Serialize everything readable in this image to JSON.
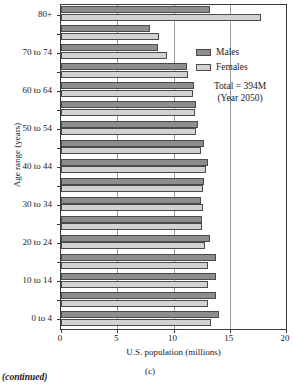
{
  "chart_data": {
    "type": "bar",
    "orientation": "horizontal",
    "title": "",
    "xlabel": "U.S. population (millions)",
    "ylabel": "Age range (years)",
    "xlim": [
      0,
      20
    ],
    "xticks": [
      0,
      5,
      10,
      15,
      20
    ],
    "xtick_labels": [
      "0",
      "5",
      "10",
      "15",
      "20"
    ],
    "grid": "vertical-at-xticks",
    "legend_position": "upper right inside",
    "categories": [
      "0 to 4",
      "5 to 9",
      "10 to 14",
      "15 to 19",
      "20 to 24",
      "25 to 29",
      "30 to 34",
      "35 to 39",
      "40 to 44",
      "45 to 49",
      "50 to 54",
      "55 to 59",
      "60 to 64",
      "65 to 69",
      "70 to 74",
      "75 to 79",
      "80+"
    ],
    "ytick_labels_shown": [
      "0 to 4",
      "10 to 14",
      "20 to 24",
      "30 to 34",
      "40 to 44",
      "50 to 54",
      "60 to 64",
      "70 to 74",
      "80+"
    ],
    "series": [
      {
        "name": "Males",
        "color": "#8d8d8d",
        "values": [
          14.0,
          13.8,
          13.8,
          13.8,
          13.2,
          12.5,
          12.4,
          12.7,
          13.1,
          12.7,
          12.2,
          12.0,
          11.8,
          11.2,
          8.6,
          7.9,
          13.2
        ]
      },
      {
        "name": "Females",
        "color": "#d2d2d2",
        "values": [
          13.3,
          13.1,
          13.1,
          13.1,
          12.8,
          12.5,
          12.6,
          12.6,
          12.9,
          12.4,
          12.0,
          11.9,
          11.7,
          11.3,
          9.4,
          8.7,
          17.8
        ]
      }
    ],
    "annotations": [
      "Total = 394M",
      "(Year 2050)"
    ]
  },
  "legend": {
    "items": [
      {
        "label": "Males",
        "swatch": "male"
      },
      {
        "label": "Females",
        "swatch": "female"
      }
    ]
  },
  "annotation": {
    "line1": "Total = 394M",
    "line2": "(Year 2050)"
  },
  "captions": {
    "panel": "(c)",
    "continued": "(continued)"
  }
}
